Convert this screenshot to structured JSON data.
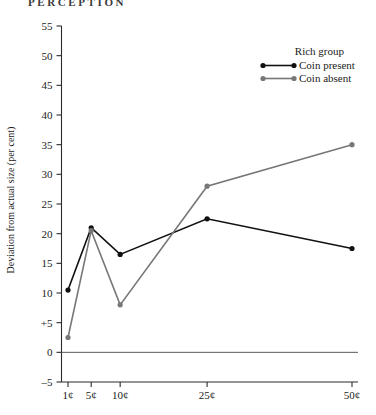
{
  "running_head": "PERCEPTION",
  "chart_data": {
    "type": "line",
    "title": "",
    "xlabel": "",
    "ylabel": "Deviation from actual size (per cent)",
    "categories": [
      "1¢",
      "5¢",
      "10¢",
      "25¢",
      "50¢"
    ],
    "x": [
      1,
      5,
      10,
      25,
      50
    ],
    "ylim": [
      -5,
      55
    ],
    "yticks": [
      -5,
      0,
      5,
      10,
      15,
      20,
      25,
      30,
      35,
      40,
      45,
      50,
      55
    ],
    "ytick_labels": [
      "–5",
      "0",
      "+5",
      "10",
      "15",
      "20",
      "25",
      "30",
      "35",
      "40",
      "45",
      "50",
      "55"
    ],
    "grid": false,
    "zero_line": true,
    "legend_position": "top-right",
    "legend_title": "Rich group",
    "series": [
      {
        "name": "Coin present",
        "color": "#111111",
        "values": [
          10.5,
          21.0,
          16.5,
          22.5,
          17.5
        ]
      },
      {
        "name": "Coin absent",
        "color": "#777777",
        "values": [
          2.5,
          20.5,
          8.0,
          28.0,
          35.0
        ]
      }
    ]
  }
}
